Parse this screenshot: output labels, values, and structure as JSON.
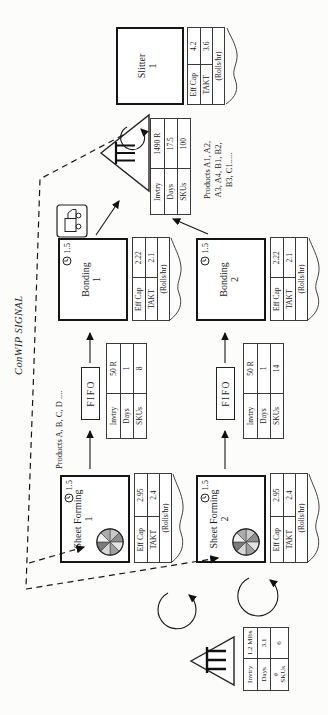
{
  "conwip": {
    "label": "ConWIP SIGNAL"
  },
  "labels": {
    "fifo": "FIFO",
    "products_line1": "Products A, B, C, D ....",
    "products_fg": "Products A1, A2,\nA3, A4, B1, B2,\nB3, C1....."
  },
  "boxes": {
    "sf1": {
      "title": "Sheet Forming",
      "num": "1",
      "changeover": "1.5"
    },
    "sf2": {
      "title": "Sheet Forming",
      "num": "2",
      "changeover": "1.5"
    },
    "b1": {
      "title": "Bonding",
      "num": "1",
      "changeover": "1.5"
    },
    "b2": {
      "title": "Bonding",
      "num": "2",
      "changeover": "1.5"
    },
    "sl": {
      "title": "Slitter",
      "num": "1"
    }
  },
  "tables": {
    "sf1": {
      "r0l": "Eff Cap",
      "r0v": "2.95",
      "r1l": "TAKT",
      "r1v": "2.4",
      "unit": "(Rolls/hr)"
    },
    "sf2": {
      "r0l": "Eff Cap",
      "r0v": "2.95",
      "r1l": "TAKT",
      "r1v": "2.4",
      "unit": "(Rolls/hr)"
    },
    "b1": {
      "r0l": "Eff Cap",
      "r0v": "2.22",
      "r1l": "TAKT",
      "r1v": "2.1",
      "unit": "(Rolls/hr)"
    },
    "b2": {
      "r0l": "Eff Cap",
      "r0v": "2.22",
      "r1l": "TAKT",
      "r1v": "2.1",
      "unit": "(Rolls/hr)"
    },
    "sl": {
      "r0l": "Eff Cap",
      "r0v": "4.2",
      "r1l": "TAKT",
      "r1v": "3.6",
      "unit": "(Rolls/hr)"
    },
    "fifo1": {
      "r0l": "Invtry",
      "r0v": "50 R",
      "r1l": "Days",
      "r1v": "1",
      "r2l": "SKUs",
      "r2v": "8"
    },
    "fifo2": {
      "r0l": "Invtry",
      "r0v": "50 R",
      "r1l": "Days",
      "r1v": "1",
      "r2l": "SKUs",
      "r2v": "14"
    },
    "raw": {
      "r0l": "Invtry",
      "r0v": "1.2 Mlbs",
      "r1l": "Days",
      "r1v": "3.1",
      "r2l": "#\nSKUs",
      "r2v": "6"
    },
    "fg": {
      "r0l": "Invtry",
      "r0v": "1490 R",
      "r1l": "Days",
      "r1v": "17.5",
      "r2l": "SKUs",
      "r2v": "100"
    }
  }
}
